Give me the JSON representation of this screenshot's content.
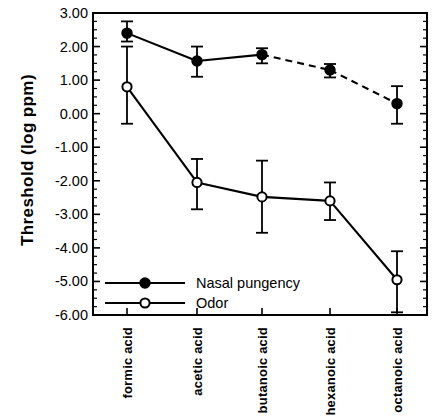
{
  "chart_data": {
    "type": "line",
    "title": "",
    "xlabel": "",
    "ylabel": "Threshold  (log  ppm)",
    "categories": [
      "formic acid",
      "acetic acid",
      "butanoic acid",
      "hexanoic acid",
      "octanoic acid"
    ],
    "ylim": [
      -6.0,
      3.0
    ],
    "yticks": [
      3.0,
      2.0,
      1.0,
      0.0,
      -1.0,
      -2.0,
      -3.0,
      -4.0,
      -5.0,
      -6.0
    ],
    "ytick_labels": [
      "3.00",
      "2.00",
      "1.00",
      "0.00",
      "-1.00",
      "-2.00",
      "-3.00",
      "-4.00",
      "-5.00",
      "-6.00"
    ],
    "y_minor_tick_step": 0.25,
    "grid": false,
    "legend_position": "lower left inside axes",
    "series": [
      {
        "name": "Nasal pungency",
        "marker": "filled-circle",
        "values": [
          2.4,
          1.57,
          1.76,
          1.3,
          0.3
        ],
        "err_upper": [
          2.75,
          2.0,
          1.95,
          1.48,
          0.82
        ],
        "err_lower": [
          2.15,
          1.1,
          1.5,
          1.08,
          -0.3
        ],
        "line_style_segments": [
          "solid",
          "solid",
          "dashed",
          "dashed"
        ]
      },
      {
        "name": "Odor",
        "marker": "open-circle",
        "values": [
          0.8,
          -2.05,
          -2.48,
          -2.6,
          -4.95
        ],
        "err_upper": [
          2.0,
          -1.35,
          -1.4,
          -2.05,
          -4.1
        ],
        "err_lower": [
          -0.3,
          -2.85,
          -3.55,
          -3.17,
          -5.92
        ],
        "line_style_segments": [
          "solid",
          "solid",
          "solid",
          "solid"
        ]
      }
    ]
  },
  "legend": {
    "items": [
      {
        "label": "Nasal pungency",
        "marker": "filled-circle"
      },
      {
        "label": "Odor",
        "marker": "open-circle"
      }
    ]
  },
  "colors": {
    "axis": "#000000",
    "series_line": "#000000",
    "marker_fill_filled": "#000000",
    "marker_fill_open": "#ffffff",
    "background": "#ffffff"
  }
}
